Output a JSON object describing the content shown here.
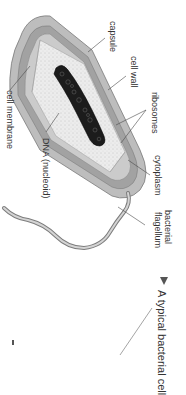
{
  "diagram": {
    "caption": "A typical bacterial cell",
    "caption_marker": "triangle",
    "labels": {
      "capsule": "capsule",
      "cell_wall": "cell wall",
      "ribosomes": "ribosomes",
      "cytoplasm": "cytoplasm",
      "flagellum_line1": "bacterial",
      "flagellum_line2": "flagellum",
      "dna": "DNA (nucleoid)",
      "cell_membrane": "cell membrane"
    },
    "colors": {
      "capsule": "#b8b8b8",
      "cell_wall": "#9a9a9a",
      "membrane": "#c6c6c6",
      "cytoplasm": "#e8e8e8",
      "dna": "#1a1a1a",
      "leader": "#444444",
      "text": "#333333"
    },
    "orientation": "rotated 90deg clockwise"
  }
}
